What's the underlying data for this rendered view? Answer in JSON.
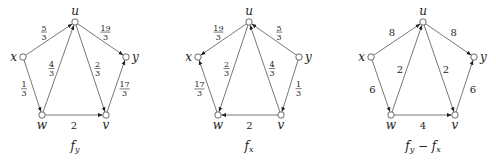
{
  "figure": {
    "graphs": [
      {
        "caption": "f_y",
        "caption_parts": [
          "f",
          "y"
        ],
        "offset_x": 0,
        "nodes": {
          "u": {
            "label": "u",
            "x": 75,
            "y": 22
          },
          "x": {
            "label": "x",
            "x": 23,
            "y": 57
          },
          "y": {
            "label": "y",
            "x": 126,
            "y": 57
          },
          "w": {
            "label": "w",
            "x": 42,
            "y": 115
          },
          "v": {
            "label": "v",
            "x": 106,
            "y": 115
          }
        },
        "edges": [
          {
            "from": "x",
            "to": "u",
            "weight": "5/3"
          },
          {
            "from": "u",
            "to": "y",
            "weight": "19/3"
          },
          {
            "from": "w",
            "to": "u",
            "weight": "4/3"
          },
          {
            "from": "u",
            "to": "v",
            "weight": "2/3"
          },
          {
            "from": "x",
            "to": "w",
            "weight": "1/3"
          },
          {
            "from": "v",
            "to": "y",
            "weight": "17/3"
          },
          {
            "from": "w",
            "to": "v",
            "weight": "2"
          }
        ]
      },
      {
        "caption": "f_x",
        "caption_parts": [
          "f",
          "x"
        ],
        "offset_x": 174,
        "nodes": {
          "u": {
            "label": "u",
            "x": 249,
            "y": 22
          },
          "x": {
            "label": "x",
            "x": 198,
            "y": 57
          },
          "y": {
            "label": "y",
            "x": 299,
            "y": 57
          },
          "w": {
            "label": "w",
            "x": 218,
            "y": 115
          },
          "v": {
            "label": "v",
            "x": 281,
            "y": 115
          }
        },
        "edges": [
          {
            "from": "u",
            "to": "x",
            "weight": "19/3"
          },
          {
            "from": "y",
            "to": "u",
            "weight": "5/3"
          },
          {
            "from": "u",
            "to": "w",
            "weight": "2/3"
          },
          {
            "from": "v",
            "to": "u",
            "weight": "4/3"
          },
          {
            "from": "w",
            "to": "x",
            "weight": "17/3"
          },
          {
            "from": "y",
            "to": "v",
            "weight": "1/3"
          },
          {
            "from": "v",
            "to": "w",
            "weight": "2"
          }
        ]
      },
      {
        "caption": "f_y − f_x",
        "caption_parts": [
          "f",
          "y",
          " − ",
          "f",
          "x"
        ],
        "offset_x": 348,
        "nodes": {
          "u": {
            "label": "u",
            "x": 423,
            "y": 22
          },
          "x": {
            "label": "x",
            "x": 371,
            "y": 57
          },
          "y": {
            "label": "y",
            "x": 474,
            "y": 57
          },
          "w": {
            "label": "w",
            "x": 391,
            "y": 115
          },
          "v": {
            "label": "v",
            "x": 455,
            "y": 115
          }
        },
        "edges": [
          {
            "from": "x",
            "to": "u",
            "weight": "8"
          },
          {
            "from": "u",
            "to": "y",
            "weight": "8"
          },
          {
            "from": "w",
            "to": "u",
            "weight": "2"
          },
          {
            "from": "u",
            "to": "v",
            "weight": "2"
          },
          {
            "from": "x",
            "to": "w",
            "weight": "6"
          },
          {
            "from": "v",
            "to": "y",
            "weight": "6"
          },
          {
            "from": "w",
            "to": "v",
            "weight": "4"
          }
        ]
      }
    ]
  }
}
